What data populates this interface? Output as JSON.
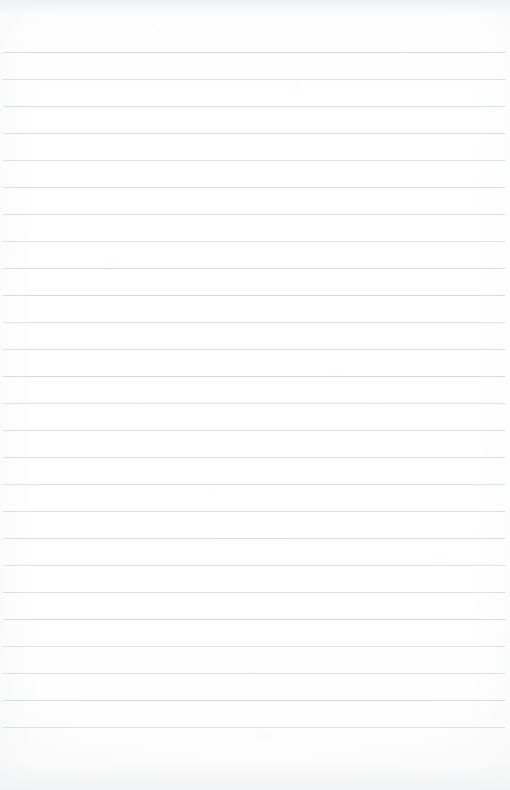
{
  "document": {
    "type": "lined-notebook-page",
    "title": "Blank ruled notebook page",
    "content_text": "",
    "has_handwriting": false,
    "has_printed_text": false,
    "page_width_px": 510,
    "page_height_px": 790
  },
  "paper": {
    "background_color": "#fdfdfd",
    "base_color": "#ffffff",
    "edge_shadow_color": "#eceef0",
    "texture": "subtle scan grain with soft vignette"
  },
  "ruling": {
    "line_color": "#d6d9dd",
    "line_thickness_px": 1,
    "line_spacing_px": 27,
    "first_line_y_px": 52,
    "last_line_y_px": 740,
    "line_count": 26,
    "left_margin_px": 3,
    "right_margin_px": 5,
    "has_vertical_margin_rule": false,
    "line_y_positions": [
      52,
      79,
      106,
      133,
      160,
      187,
      214,
      241,
      268,
      295,
      322,
      349,
      376,
      403,
      430,
      457,
      484,
      511,
      538,
      565,
      592,
      619,
      646,
      673,
      700,
      727
    ]
  }
}
